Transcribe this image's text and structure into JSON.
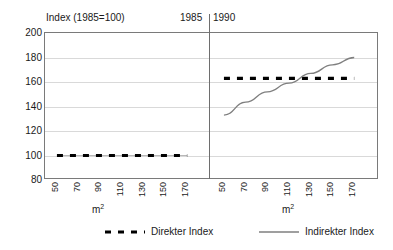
{
  "chart_data": {
    "type": "line",
    "title": "Index (1985=100)",
    "xlabel": "m²",
    "ylabel": "",
    "ylim": [
      80,
      200
    ],
    "yticks": [
      200,
      180,
      160,
      140,
      120,
      100,
      80
    ],
    "xlim": [
      50,
      170
    ],
    "x": [
      50,
      70,
      90,
      110,
      130,
      150,
      170
    ],
    "xticks": [
      "50",
      "70",
      "90",
      "110",
      "130",
      "150",
      "170"
    ],
    "grid": true,
    "legend_position": "bottom",
    "panels": [
      {
        "name": "1985",
        "label": "1985",
        "xlabel": "m²",
        "series": [
          {
            "name": "Direkter Index",
            "style": "dashed",
            "color": "#000000",
            "values": [
              100,
              100,
              100,
              100,
              100,
              100,
              100
            ]
          }
        ]
      },
      {
        "name": "1990",
        "label": "1990",
        "xlabel": "m²",
        "series": [
          {
            "name": "Direkter Index",
            "style": "dashed",
            "color": "#000000",
            "values": [
              163,
              163,
              163,
              163,
              163,
              163,
              163
            ]
          },
          {
            "name": "Indirekter Index",
            "style": "solid",
            "color": "#7f7f7f",
            "values": [
              133,
              143.5,
              152,
              159,
              167,
              174,
              180
            ]
          }
        ]
      }
    ],
    "legend": [
      {
        "label": "Direkter Index",
        "style": "dashed",
        "color": "#000000"
      },
      {
        "label": "Indirekter Index",
        "style": "solid",
        "color": "#7f7f7f"
      }
    ]
  },
  "colors": {
    "direkter": "#000000",
    "indirekter": "#7f7f7f",
    "grid": "#d9d9d9",
    "axis": "#7a7a7a",
    "text": "#1a1a1a"
  }
}
